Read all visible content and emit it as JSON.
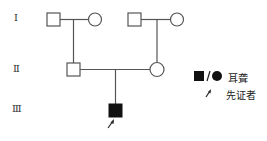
{
  "generations": [
    {
      "label": "Ⅰ"
    },
    {
      "label": "Ⅱ"
    },
    {
      "label": "Ⅲ"
    }
  ],
  "individuals": [
    {
      "id": "I-1",
      "generation": "Ⅰ",
      "sex": "male",
      "affected": false
    },
    {
      "id": "I-2",
      "generation": "Ⅰ",
      "sex": "female",
      "affected": false
    },
    {
      "id": "I-3",
      "generation": "Ⅰ",
      "sex": "male",
      "affected": false
    },
    {
      "id": "I-4",
      "generation": "Ⅰ",
      "sex": "female",
      "affected": false
    },
    {
      "id": "II-1",
      "generation": "Ⅱ",
      "sex": "male",
      "affected": false
    },
    {
      "id": "II-2",
      "generation": "Ⅱ",
      "sex": "female",
      "affected": false
    },
    {
      "id": "III-1",
      "generation": "Ⅲ",
      "sex": "male",
      "affected": true,
      "proband": true
    }
  ],
  "legend": {
    "affected_symbols": "■/●",
    "affected_label": "耳聋",
    "proband_label": "先证者"
  },
  "colors": {
    "line": "#555555",
    "affected_fill": "#111111",
    "unaffected_fill": "#ffffff"
  }
}
